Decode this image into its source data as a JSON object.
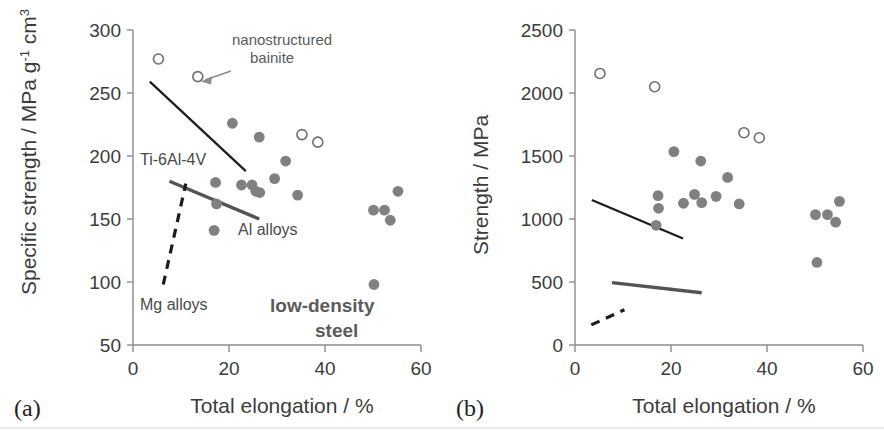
{
  "figure": {
    "background": "#ffffff",
    "marker_filled_color": "#808080",
    "marker_open_stroke": "#6e6e6e",
    "axis_color": "#8c8c8c",
    "trend_thin_color": "#1c1c1c",
    "trend_thick_color": "#545454"
  },
  "panel_a": {
    "letter": "(a)",
    "xlabel": "Total elongation / %",
    "ylabel_main": "Specific strength / MPa g",
    "ylabel_sup1": "-1",
    "ylabel_tail": " cm",
    "ylabel_sup2": "3",
    "xticks": [
      "0",
      "20",
      "40",
      "60"
    ],
    "yticks": [
      "300",
      "250",
      "200",
      "150",
      "100",
      "50"
    ],
    "labels": {
      "ti_alloy": "Ti-6Al-4V",
      "al_alloy": "Al alloys",
      "mg_alloy": "Mg alloys",
      "nanobainite_line1": "nanostructured",
      "nanobainite_line2": "bainite",
      "low_density_line1": "low-density",
      "low_density_line2": "steel"
    },
    "chart_data": {
      "type": "scatter",
      "title": "",
      "xlabel": "Total elongation / %",
      "ylabel": "Specific strength / MPa g-1 cm3",
      "xlim": [
        0,
        60
      ],
      "ylim": [
        50,
        300
      ],
      "grid": false,
      "legend": "none",
      "series": [
        {
          "name": "low-density steel",
          "marker": "filled-circle",
          "points": [
            {
              "x": 20.7,
              "y": 226
            },
            {
              "x": 26.3,
              "y": 215
            },
            {
              "x": 31.8,
              "y": 196
            },
            {
              "x": 29.5,
              "y": 182
            },
            {
              "x": 17.2,
              "y": 179
            },
            {
              "x": 22.6,
              "y": 177
            },
            {
              "x": 24.8,
              "y": 177
            },
            {
              "x": 25.6,
              "y": 172
            },
            {
              "x": 26.4,
              "y": 171
            },
            {
              "x": 34.3,
              "y": 169
            },
            {
              "x": 55.2,
              "y": 172
            },
            {
              "x": 52.4,
              "y": 157
            },
            {
              "x": 50.1,
              "y": 157
            },
            {
              "x": 53.6,
              "y": 149
            },
            {
              "x": 17.4,
              "y": 162
            },
            {
              "x": 16.9,
              "y": 141
            },
            {
              "x": 50.2,
              "y": 98
            }
          ]
        },
        {
          "name": "nanostructured bainite",
          "marker": "open-circle",
          "points": [
            {
              "x": 5.3,
              "y": 277
            },
            {
              "x": 13.5,
              "y": 263
            },
            {
              "x": 35.2,
              "y": 217
            },
            {
              "x": 38.5,
              "y": 211
            }
          ]
        }
      ],
      "trendlines": [
        {
          "name": "Ti-6Al-4V",
          "style": "solid-thin",
          "x1": 3.5,
          "y1": 259,
          "x2": 23.5,
          "y2": 188
        },
        {
          "name": "Al alloys",
          "style": "solid-thick",
          "x1": 7.6,
          "y1": 180,
          "x2": 26.3,
          "y2": 150
        },
        {
          "name": "Mg alloys",
          "style": "dashed",
          "x1": 6.3,
          "y1": 98,
          "x2": 11.0,
          "y2": 178
        }
      ],
      "annotations": [
        {
          "text": "nanostructured bainite",
          "points_to": {
            "x": 13.5,
            "y": 263
          }
        },
        {
          "text": "low-density steel",
          "x": 42,
          "y": 78
        }
      ]
    }
  },
  "panel_b": {
    "letter": "(b)",
    "xlabel": "Total elongation / %",
    "ylabel": "Strength / MPa",
    "xticks": [
      "0",
      "20",
      "40",
      "60"
    ],
    "yticks": [
      "2500",
      "2000",
      "1500",
      "1000",
      "500",
      "0"
    ],
    "chart_data": {
      "type": "scatter",
      "title": "",
      "xlabel": "Total elongation / %",
      "ylabel": "Strength / MPa",
      "xlim": [
        0,
        60
      ],
      "ylim": [
        0,
        2500
      ],
      "grid": false,
      "legend": "none",
      "series": [
        {
          "name": "low-density steel",
          "marker": "filled-circle",
          "points": [
            {
              "x": 20.6,
              "y": 1535
            },
            {
              "x": 26.2,
              "y": 1460
            },
            {
              "x": 31.8,
              "y": 1330
            },
            {
              "x": 17.3,
              "y": 1185
            },
            {
              "x": 24.9,
              "y": 1195
            },
            {
              "x": 29.4,
              "y": 1180
            },
            {
              "x": 17.4,
              "y": 1085
            },
            {
              "x": 22.6,
              "y": 1125
            },
            {
              "x": 26.4,
              "y": 1130
            },
            {
              "x": 34.2,
              "y": 1120
            },
            {
              "x": 55.1,
              "y": 1140
            },
            {
              "x": 50.1,
              "y": 1035
            },
            {
              "x": 52.6,
              "y": 1035
            },
            {
              "x": 54.3,
              "y": 975
            },
            {
              "x": 16.9,
              "y": 950
            },
            {
              "x": 50.4,
              "y": 655
            }
          ]
        },
        {
          "name": "nanostructured bainite",
          "marker": "open-circle",
          "points": [
            {
              "x": 5.2,
              "y": 2155
            },
            {
              "x": 16.6,
              "y": 2050
            },
            {
              "x": 35.2,
              "y": 1685
            },
            {
              "x": 38.4,
              "y": 1645
            }
          ]
        }
      ],
      "trendlines": [
        {
          "name": "Ti-6Al-4V",
          "style": "solid-thin",
          "x1": 3.5,
          "y1": 1150,
          "x2": 22.5,
          "y2": 845
        },
        {
          "name": "Al alloys",
          "style": "solid-thick",
          "x1": 7.7,
          "y1": 495,
          "x2": 26.4,
          "y2": 415
        },
        {
          "name": "Mg alloys",
          "style": "dashed",
          "x1": 3.4,
          "y1": 160,
          "x2": 10.3,
          "y2": 280
        }
      ]
    }
  }
}
